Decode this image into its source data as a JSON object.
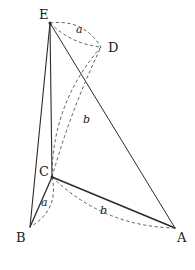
{
  "figure": {
    "background_color": "#ffffff",
    "stroke_color": "#2b2b2b",
    "dash_color": "#4a4a4a",
    "vertices": [
      {
        "id": "E",
        "label": "E",
        "x": 50,
        "y": 23,
        "label_x": 39,
        "label_y": 8
      },
      {
        "id": "D",
        "label": "D",
        "x": 101,
        "y": 47,
        "label_x": 108,
        "label_y": 41
      },
      {
        "id": "C",
        "label": "C",
        "x": 52,
        "y": 177,
        "label_x": 39,
        "label_y": 165
      },
      {
        "id": "B",
        "label": "B",
        "x": 30,
        "y": 227,
        "label_x": 16,
        "label_y": 231
      },
      {
        "id": "A",
        "label": "A",
        "x": 175,
        "y": 228,
        "label_x": 177,
        "label_y": 231
      }
    ],
    "solid_edges": [
      {
        "name": "edge-E-B",
        "from": "E",
        "to": "B",
        "width": 1.1
      },
      {
        "name": "edge-E-C",
        "from": "E",
        "to": "C",
        "width": 1.1
      },
      {
        "name": "edge-E-A",
        "from": "E",
        "to": "A",
        "width": 1.0
      },
      {
        "name": "edge-C-B",
        "from": "C",
        "to": "B",
        "width": 1.3
      },
      {
        "name": "edge-C-A",
        "from": "C",
        "to": "A",
        "width": 1.5
      },
      {
        "name": "edge-B-A-hidden",
        "from": "B",
        "to": "A",
        "width": 0.0
      }
    ],
    "dashed_arcs": [
      {
        "name": "arc-E-D-upper",
        "from": "E",
        "to": "D",
        "bow": -9
      },
      {
        "name": "arc-E-D-lower",
        "from": "E",
        "to": "D",
        "bow": 5
      },
      {
        "name": "arc-C-D-left",
        "from": "C",
        "to": "D",
        "bow": -13
      },
      {
        "name": "arc-C-D-right",
        "from": "C",
        "to": "D",
        "bow": -3
      },
      {
        "name": "arc-C-B-right",
        "from": "C",
        "to": "B",
        "bow": -10
      },
      {
        "name": "arc-C-A-below",
        "from": "C",
        "to": "A",
        "bow": 13
      }
    ],
    "length_labels": [
      {
        "name": "length-label-a-top",
        "text": "a",
        "x": 76,
        "y": 24
      },
      {
        "name": "length-label-b-middle",
        "text": "b",
        "x": 83,
        "y": 114
      },
      {
        "name": "length-label-a-bottom",
        "text": "a",
        "x": 41,
        "y": 197
      },
      {
        "name": "length-label-b-bottom",
        "text": "b",
        "x": 100,
        "y": 205
      }
    ]
  }
}
